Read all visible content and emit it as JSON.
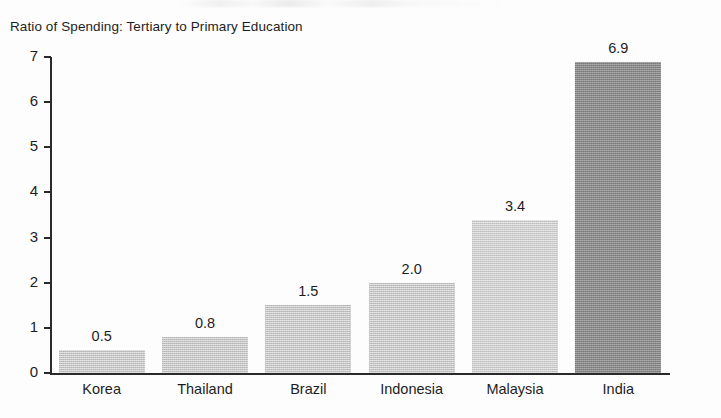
{
  "chart_data": {
    "type": "bar",
    "title": "Ratio of Spending: Tertiary to Primary Education",
    "xlabel": "",
    "ylabel": "",
    "categories": [
      "Korea",
      "Thailand",
      "Brazil",
      "Indonesia",
      "Malaysia",
      "India"
    ],
    "values": [
      0.5,
      0.8,
      1.5,
      2.0,
      3.4,
      6.9
    ],
    "value_labels": [
      "0.5",
      "0.8",
      "1.5",
      "2.0",
      "3.4",
      "6.9"
    ],
    "ylim": [
      0,
      7
    ],
    "yticks": [
      0,
      1,
      2,
      3,
      4,
      5,
      6,
      7
    ],
    "ytick_labels": [
      "0",
      "1",
      "2",
      "3",
      "4",
      "5",
      "6",
      "7"
    ],
    "grid": false,
    "legend": null,
    "bar_colors": [
      "#c3c3c3",
      "#c3c3c3",
      "#c3c3c3",
      "#c3c3c3",
      "#cacaca",
      "#888888"
    ],
    "highlight_category": "India",
    "axis_color": "#2a2a2a",
    "text_color": "#1d1d1d",
    "background": "#fdfdfd"
  }
}
